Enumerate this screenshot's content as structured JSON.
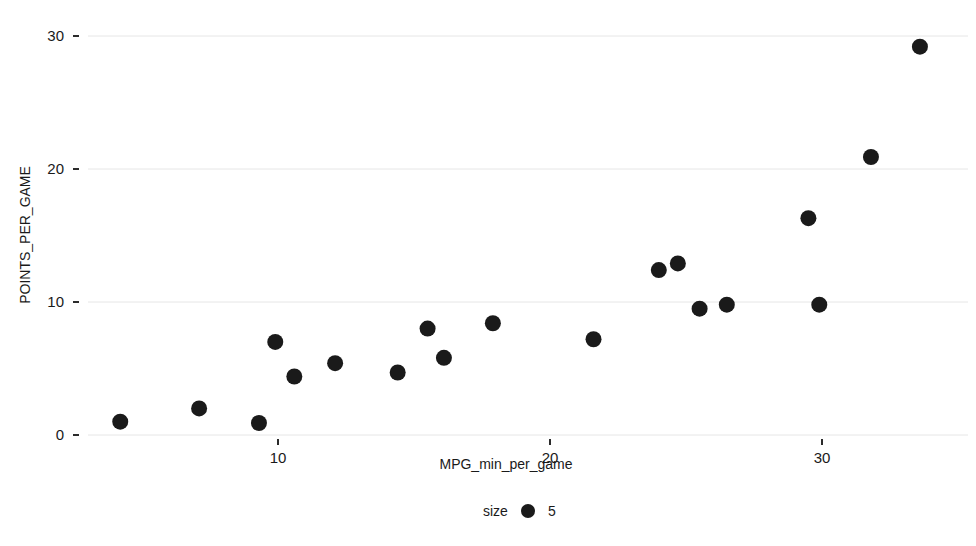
{
  "chart_data": {
    "type": "scatter",
    "title": "",
    "xlabel": "MPG_min_per_game",
    "ylabel": "POINTS_PER_GAME",
    "xlim": [
      2.0,
      35.5
    ],
    "ylim": [
      -1.0,
      31.0
    ],
    "xticks": [
      10,
      20,
      30
    ],
    "xtick_labels": [
      "10",
      "20",
      "30"
    ],
    "yticks": [
      0,
      10,
      20,
      30
    ],
    "ytick_labels": [
      "0",
      "10",
      "20",
      "30"
    ],
    "grid": "horizontal",
    "grid_color": "#e6e6e6",
    "point_color": "#1a1a1a",
    "point_size": 5,
    "legend": {
      "position": "bottom",
      "title": "size",
      "entries": [
        {
          "label": "5",
          "marker": "circle",
          "color": "#1a1a1a"
        }
      ]
    },
    "x": [
      4.2,
      7.1,
      9.3,
      9.9,
      10.6,
      12.1,
      14.4,
      15.5,
      16.1,
      17.9,
      21.6,
      24.0,
      24.7,
      25.5,
      26.5,
      29.5,
      29.9,
      31.8,
      33.6
    ],
    "y": [
      1.0,
      2.0,
      0.9,
      7.0,
      4.4,
      5.4,
      4.7,
      8.0,
      5.8,
      8.4,
      7.2,
      12.4,
      12.9,
      9.5,
      9.8,
      16.3,
      9.8,
      20.9,
      29.2
    ],
    "points": [
      {
        "x": 4.2,
        "y": 1.0
      },
      {
        "x": 7.1,
        "y": 2.0
      },
      {
        "x": 9.3,
        "y": 0.9
      },
      {
        "x": 9.9,
        "y": 7.0
      },
      {
        "x": 10.6,
        "y": 4.4
      },
      {
        "x": 12.1,
        "y": 5.4
      },
      {
        "x": 14.4,
        "y": 4.7
      },
      {
        "x": 15.5,
        "y": 8.0
      },
      {
        "x": 16.1,
        "y": 5.8
      },
      {
        "x": 17.9,
        "y": 8.4
      },
      {
        "x": 21.6,
        "y": 7.2
      },
      {
        "x": 24.0,
        "y": 12.4
      },
      {
        "x": 24.7,
        "y": 12.9
      },
      {
        "x": 25.5,
        "y": 9.5
      },
      {
        "x": 26.5,
        "y": 9.8
      },
      {
        "x": 29.5,
        "y": 16.3
      },
      {
        "x": 29.9,
        "y": 9.8
      },
      {
        "x": 31.8,
        "y": 20.9
      },
      {
        "x": 33.6,
        "y": 29.2
      }
    ]
  }
}
